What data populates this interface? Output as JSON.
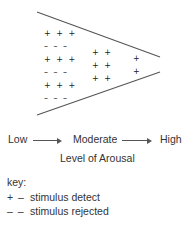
{
  "diagram": {
    "type": "funnel",
    "stroke_color": "#555555",
    "columns": [
      {
        "name": "low",
        "rows": [
          "+++",
          "---",
          "+++",
          "---",
          "+++",
          "---"
        ]
      },
      {
        "name": "moderate",
        "rows": [
          "++",
          "++",
          "++"
        ]
      },
      {
        "name": "high",
        "rows": [
          "+",
          "+"
        ]
      }
    ]
  },
  "axis": {
    "low": "Low",
    "moderate": "Moderate",
    "high": "High",
    "title": "Level of Arousal"
  },
  "key": {
    "title": "key:",
    "items": [
      {
        "symbol": "+ –",
        "label": "stimulus detect"
      },
      {
        "symbol": "– –",
        "label": "stimulus rejected"
      }
    ]
  }
}
